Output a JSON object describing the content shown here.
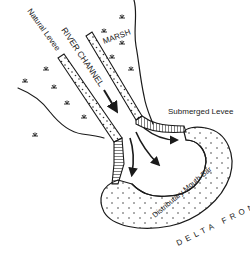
{
  "diagram": {
    "labels": {
      "natural_levee": "Natural Levee",
      "river_channel": "RIVER CHANNEL",
      "marsh": "MARSH",
      "submerged_levee": "Submerged Levee",
      "distributary_mouth_bar": "Distributary Mouth Bar",
      "delta_front": "DELTA FRONT"
    },
    "icons": {
      "marsh_vegetation": "marsh-grass-tuft",
      "flow_direction": "arrow"
    },
    "colors": {
      "ink": "#1a1a1a",
      "background": "#ffffff"
    }
  }
}
